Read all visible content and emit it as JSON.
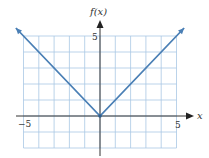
{
  "chart_data": {
    "type": "line",
    "title": "",
    "xlabel": "x",
    "ylabel": "f(x)",
    "xlim": [
      -5,
      5
    ],
    "ylim": [
      -2,
      5
    ],
    "grid": true,
    "x_tick_labels": [
      "-5",
      "5"
    ],
    "y_tick_labels": [
      "5"
    ],
    "series": [
      {
        "name": "f(x) = |x|",
        "x": [
          -5.5,
          0,
          5.5
        ],
        "y": [
          5.5,
          0,
          5.5
        ],
        "arrows_at_ends": true
      }
    ]
  },
  "labels": {
    "x_axis": "x",
    "y_axis": "f(x)",
    "x_min": "−5",
    "x_max": "5",
    "y_max": "5"
  },
  "colors": {
    "grid": "#a9c8e4",
    "line": "#4a7fb5",
    "axis": "#333333"
  }
}
